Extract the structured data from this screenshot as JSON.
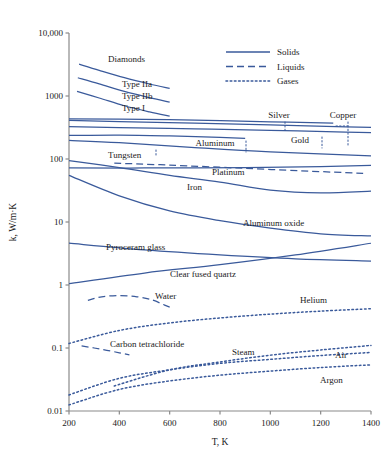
{
  "chart_data": {
    "type": "line",
    "title": "",
    "xlabel": "T, K",
    "ylabel": "k, W/m·K",
    "xlim": [
      200,
      1400
    ],
    "ylim": [
      0.01,
      10000
    ],
    "yscale": "log",
    "xscale": "linear",
    "grid": false,
    "xticks": [
      200,
      400,
      600,
      800,
      1000,
      1200,
      1400
    ],
    "xticklabels": [
      "200",
      "400",
      "600",
      "800",
      "1000",
      "1200",
      "1400"
    ],
    "yticks": [
      0.01,
      0.1,
      1,
      10,
      100,
      1000,
      10000
    ],
    "yticklabels": [
      "0.01",
      "0.1",
      "1",
      "10",
      "100",
      "1000",
      "10,000"
    ],
    "legend_position": "upper-right",
    "legend": [
      {
        "label": "Solids",
        "style": "solid"
      },
      {
        "label": "Liquids",
        "style": "dashed"
      },
      {
        "label": "Gases",
        "style": "dotted"
      }
    ],
    "series": [
      {
        "name": "Diamonds",
        "style": "solid",
        "is_group_label": true,
        "x": [],
        "y": []
      },
      {
        "name": "Type IIa",
        "style": "solid",
        "x": [
          240,
          320,
          420,
          520,
          600
        ],
        "y": [
          3200,
          2550,
          1950,
          1550,
          1320
        ]
      },
      {
        "name": "Type IIb",
        "style": "solid",
        "x": [
          235,
          320,
          420,
          520,
          600
        ],
        "y": [
          1950,
          1560,
          1180,
          940,
          800
        ]
      },
      {
        "name": "Type I",
        "style": "solid",
        "x": [
          232,
          320,
          420,
          520,
          600
        ],
        "y": [
          1180,
          930,
          700,
          560,
          480
        ]
      },
      {
        "name": "Silver",
        "style": "solid",
        "x": [
          200,
          400,
          700,
          1000,
          1250
        ],
        "y": [
          435,
          428,
          415,
          390,
          370
        ]
      },
      {
        "name": "Copper",
        "style": "solid",
        "x": [
          200,
          400,
          700,
          1000,
          1300,
          1400
        ],
        "y": [
          410,
          393,
          370,
          348,
          325,
          318
        ]
      },
      {
        "name": "Gold",
        "style": "solid",
        "x": [
          200,
          400,
          700,
          1000,
          1300,
          1400
        ],
        "y": [
          327,
          315,
          300,
          285,
          268,
          262
        ]
      },
      {
        "name": "Aluminum",
        "style": "solid",
        "x": [
          200,
          400,
          600,
          800,
          900
        ],
        "y": [
          237,
          240,
          232,
          220,
          213
        ]
      },
      {
        "name": "Sodium (liquid)",
        "style": "dashed",
        "x": [
          380,
          600,
          900,
          1200,
          1380
        ],
        "y": [
          86,
          80,
          71,
          63,
          59
        ]
      },
      {
        "name": "Tungsten",
        "style": "solid",
        "x": [
          200,
          400,
          700,
          1000,
          1400
        ],
        "y": [
          197,
          182,
          152,
          130,
          112
        ]
      },
      {
        "name": "Platinum",
        "style": "solid",
        "x": [
          200,
          500,
          900,
          1200,
          1400
        ],
        "y": [
          72,
          72,
          73,
          76,
          79
        ]
      },
      {
        "name": "Iron",
        "style": "solid",
        "x": [
          200,
          400,
          600,
          800,
          1000,
          1200,
          1400
        ],
        "y": [
          94,
          73,
          55,
          43,
          32,
          29,
          31
        ]
      },
      {
        "name": "Aluminum oxide",
        "style": "solid",
        "x": [
          200,
          400,
          600,
          800,
          1000,
          1200,
          1400
        ],
        "y": [
          55,
          26,
          15,
          10.5,
          8.0,
          6.5,
          6.0
        ]
      },
      {
        "name": "Pyroceram glass",
        "style": "solid",
        "x": [
          200,
          500,
          800,
          1100,
          1400
        ],
        "y": [
          4.6,
          3.6,
          3.0,
          2.6,
          2.4
        ]
      },
      {
        "name": "Clear fused quartz",
        "style": "solid",
        "x": [
          200,
          500,
          800,
          1100,
          1400
        ],
        "y": [
          1.05,
          1.55,
          2.1,
          3.0,
          4.6
        ]
      },
      {
        "name": "Water",
        "style": "dashed",
        "x": [
          275,
          330,
          400,
          470,
          530,
          580,
          610
        ],
        "y": [
          0.57,
          0.65,
          0.68,
          0.65,
          0.58,
          0.48,
          0.43
        ]
      },
      {
        "name": "Carbon tetrachloride",
        "style": "dashed",
        "x": [
          250,
          300,
          350,
          400,
          440
        ],
        "y": [
          0.108,
          0.1,
          0.092,
          0.084,
          0.078
        ]
      },
      {
        "name": "Helium",
        "style": "dotted",
        "x": [
          200,
          400,
          600,
          800,
          1000,
          1200,
          1400
        ],
        "y": [
          0.118,
          0.19,
          0.25,
          0.3,
          0.345,
          0.385,
          0.42
        ]
      },
      {
        "name": "Steam",
        "style": "dotted",
        "x": [
          380,
          600,
          800,
          1000,
          1200,
          1400
        ],
        "y": [
          0.025,
          0.045,
          0.06,
          0.077,
          0.093,
          0.11
        ]
      },
      {
        "name": "Air",
        "style": "dotted",
        "x": [
          200,
          400,
          600,
          800,
          1000,
          1200,
          1400
        ],
        "y": [
          0.018,
          0.033,
          0.045,
          0.057,
          0.066,
          0.076,
          0.085
        ]
      },
      {
        "name": "Argon",
        "style": "dotted",
        "x": [
          200,
          400,
          600,
          800,
          1000,
          1200,
          1400
        ],
        "y": [
          0.0125,
          0.022,
          0.03,
          0.037,
          0.043,
          0.049,
          0.054
        ]
      }
    ],
    "annotations": [
      {
        "text": "Diamonds",
        "x": 108,
        "y": 62,
        "anchor": "start"
      },
      {
        "text": "Type IIa",
        "x": 122,
        "y": 87,
        "anchor": "start"
      },
      {
        "text": "Type IIb",
        "x": 122,
        "y": 99,
        "anchor": "start"
      },
      {
        "text": "Type I",
        "x": 122,
        "y": 111,
        "anchor": "start"
      },
      {
        "text": "Silver",
        "x": 279,
        "y": 118,
        "anchor": "middle"
      },
      {
        "text": "Copper",
        "x": 343,
        "y": 118,
        "anchor": "middle"
      },
      {
        "text": "Gold",
        "x": 300,
        "y": 143,
        "anchor": "middle"
      },
      {
        "text": "Aluminum",
        "x": 215,
        "y": 146,
        "anchor": "middle"
      },
      {
        "text": "Tungsten",
        "x": 108,
        "y": 158,
        "anchor": "start"
      },
      {
        "text": "Platinum",
        "x": 212,
        "y": 175,
        "anchor": "start"
      },
      {
        "text": "Iron",
        "x": 187,
        "y": 190,
        "anchor": "start"
      },
      {
        "text": "Aluminum oxide",
        "x": 243,
        "y": 226,
        "anchor": "start"
      },
      {
        "text": "Pyroceram glass",
        "x": 106,
        "y": 250,
        "anchor": "start"
      },
      {
        "text": "Clear fused quartz",
        "x": 170,
        "y": 277,
        "anchor": "start"
      },
      {
        "text": "Water",
        "x": 155,
        "y": 299,
        "anchor": "start"
      },
      {
        "text": "Carbon tetrachloride",
        "x": 110,
        "y": 347,
        "anchor": "start"
      },
      {
        "text": "Helium",
        "x": 300,
        "y": 303,
        "anchor": "start"
      },
      {
        "text": "Steam",
        "x": 232,
        "y": 355,
        "anchor": "start"
      },
      {
        "text": "Air",
        "x": 335,
        "y": 358,
        "anchor": "start"
      },
      {
        "text": "Argon",
        "x": 320,
        "y": 383,
        "anchor": "start"
      }
    ]
  },
  "colors": {
    "line": "#3a5a9b",
    "axis": "#8a8a8a",
    "text": "#1a1a1a",
    "background": "#ffffff"
  }
}
